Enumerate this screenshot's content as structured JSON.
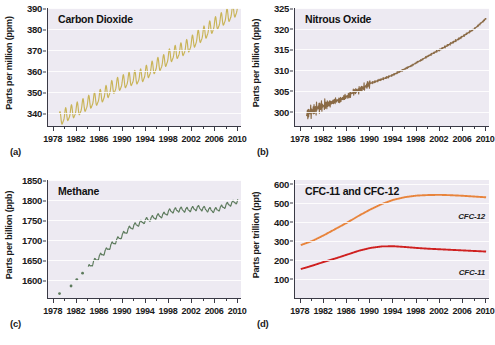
{
  "figure": {
    "panels": [
      {
        "letter": "(a)",
        "title": "Carbon Dioxide",
        "ylabel": "Parts per million (ppm)",
        "yticks": [
          340,
          350,
          360,
          370,
          380,
          390
        ],
        "ylim": [
          334,
          390
        ],
        "xticks": [
          1978,
          1982,
          1986,
          1990,
          1994,
          1998,
          2002,
          2006,
          2010
        ],
        "xlim": [
          1977,
          2010.5
        ],
        "color": "#c9b458"
      },
      {
        "letter": "(b)",
        "title": "Nitrous Oxide",
        "ylabel": "Parts per billion (ppb)",
        "yticks": [
          300,
          305,
          310,
          315,
          320,
          325
        ],
        "ylim": [
          296.5,
          325
        ],
        "xticks": [
          1978,
          1982,
          1986,
          1990,
          1994,
          1998,
          2002,
          2006,
          2010
        ],
        "xlim": [
          1977,
          2010.5
        ],
        "color": "#8a6a45"
      },
      {
        "letter": "(c)",
        "title": "Methane",
        "ylabel": "Parts per billion (ppb)",
        "yticks": [
          1600,
          1650,
          1700,
          1750,
          1800,
          1850
        ],
        "ylim": [
          1555,
          1850
        ],
        "xticks": [
          1978,
          1982,
          1986,
          1990,
          1994,
          1998,
          2002,
          2006,
          2010
        ],
        "xlim": [
          1977,
          2010.5
        ],
        "color": "#5c7a5c"
      },
      {
        "letter": "(d)",
        "title": "CFC-11 and CFC-12",
        "ylabel": "Parts per trillion (ppt)",
        "yticks": [
          100,
          200,
          300,
          400,
          500,
          600
        ],
        "ylim": [
          0,
          620
        ],
        "xticks": [
          1978,
          1982,
          1986,
          1990,
          1994,
          1998,
          2002,
          2006,
          2010
        ],
        "xlim": [
          1977,
          2010.5
        ],
        "series_labels": [
          "CFC-12",
          "CFC-11"
        ],
        "colors": [
          "#e8843c",
          "#cf2020"
        ]
      }
    ]
  },
  "chart_data": [
    {
      "type": "line",
      "title": "Carbon Dioxide",
      "xlabel": "",
      "ylabel": "Parts per million (ppm)",
      "xlim": [
        1977,
        2010.5
      ],
      "ylim": [
        334,
        390
      ],
      "grid": true,
      "series": [
        {
          "name": "CO2",
          "color": "#c9b458",
          "note": "annual sawtooth seasonal cycle of about 6 ppm amplitude superimposed on rising trend",
          "x": [
            1979,
            1980,
            1981,
            1982,
            1983,
            1984,
            1985,
            1986,
            1987,
            1988,
            1989,
            1990,
            1991,
            1992,
            1993,
            1994,
            1995,
            1996,
            1997,
            1998,
            1999,
            2000,
            2001,
            2002,
            2003,
            2004,
            2005,
            2006,
            2007,
            2008,
            2009,
            2010
          ],
          "values": [
            336.8,
            338.7,
            340.1,
            341.4,
            343.0,
            344.6,
            346.0,
            347.4,
            349.2,
            351.6,
            353.1,
            354.4,
            355.6,
            356.4,
            357.1,
            358.8,
            360.8,
            362.6,
            363.8,
            366.6,
            368.3,
            369.5,
            371.0,
            373.1,
            375.6,
            377.4,
            379.8,
            381.9,
            383.8,
            385.6,
            387.4,
            389.8
          ]
        }
      ]
    },
    {
      "type": "line",
      "title": "Nitrous Oxide",
      "xlabel": "",
      "ylabel": "Parts per billion (ppb)",
      "xlim": [
        1977,
        2010.5
      ],
      "ylim": [
        296.5,
        325
      ],
      "grid": true,
      "series": [
        {
          "name": "N2O",
          "color": "#8a6a45",
          "note": "noisy scatter before 1990, smoother steady rise afterwards",
          "x": [
            1979,
            1980,
            1981,
            1982,
            1983,
            1984,
            1985,
            1986,
            1987,
            1988,
            1989,
            1990,
            1991,
            1992,
            1993,
            1994,
            1995,
            1996,
            1997,
            1998,
            1999,
            2000,
            2001,
            2002,
            2003,
            2004,
            2005,
            2006,
            2007,
            2008,
            2009,
            2010
          ],
          "values": [
            299.3,
            300.2,
            301.0,
            301.4,
            302.0,
            302.5,
            303.0,
            303.6,
            304.6,
            305.2,
            305.9,
            306.8,
            307.3,
            307.8,
            308.3,
            308.9,
            309.6,
            310.3,
            311.0,
            311.8,
            312.6,
            313.4,
            314.2,
            314.9,
            315.7,
            316.5,
            317.3,
            318.2,
            319.1,
            320.0,
            321.2,
            322.5
          ]
        }
      ]
    },
    {
      "type": "line",
      "title": "Methane",
      "xlabel": "",
      "ylabel": "Parts per billion (ppb)",
      "xlim": [
        1977,
        2010.5
      ],
      "ylim": [
        1555,
        1850
      ],
      "grid": true,
      "series": [
        {
          "name": "CH4 early isolated measurements",
          "color": "#5c7a5c",
          "marker": "dot",
          "x": [
            1979,
            1981,
            1982,
            1983
          ],
          "values": [
            1566,
            1585,
            1601,
            1617
          ]
        },
        {
          "name": "CH4 continuous record",
          "color": "#5c7a5c",
          "note": "rapid rise to mid 1990s then plateau near 1775 ppb, renewed rise after 2007",
          "x": [
            1984,
            1985,
            1986,
            1987,
            1988,
            1989,
            1990,
            1991,
            1992,
            1993,
            1994,
            1995,
            1996,
            1997,
            1998,
            1999,
            2000,
            2001,
            2002,
            2003,
            2004,
            2005,
            2006,
            2007,
            2008,
            2009,
            2010
          ],
          "values": [
            1630,
            1646,
            1659,
            1672,
            1687,
            1700,
            1713,
            1727,
            1736,
            1742,
            1749,
            1754,
            1759,
            1762,
            1771,
            1774,
            1776,
            1775,
            1777,
            1780,
            1778,
            1775,
            1774,
            1780,
            1787,
            1792,
            1798
          ]
        }
      ]
    },
    {
      "type": "line",
      "title": "CFC-11 and CFC-12",
      "xlabel": "",
      "ylabel": "Parts per trillion (ppt)",
      "xlim": [
        1977,
        2010.5
      ],
      "ylim": [
        0,
        620
      ],
      "grid": true,
      "series": [
        {
          "name": "CFC-12",
          "color": "#e8843c",
          "note": "rises steeply then levels near 540 ppt after 1998 and declines slightly",
          "x": [
            1978,
            1980,
            1982,
            1984,
            1986,
            1988,
            1990,
            1992,
            1994,
            1996,
            1998,
            2000,
            2002,
            2004,
            2006,
            2008,
            2010
          ],
          "values": [
            278,
            300,
            330,
            363,
            396,
            432,
            465,
            494,
            516,
            530,
            538,
            541,
            542,
            540,
            537,
            533,
            529
          ]
        },
        {
          "name": "CFC-11",
          "color": "#cf2020",
          "note": "peaks near 272 ppt around 1993 then slowly declines",
          "x": [
            1978,
            1980,
            1982,
            1984,
            1986,
            1988,
            1990,
            1992,
            1994,
            1996,
            1998,
            2000,
            2002,
            2004,
            2006,
            2008,
            2010
          ],
          "values": [
            152,
            170,
            190,
            208,
            228,
            248,
            263,
            271,
            272,
            268,
            263,
            259,
            256,
            253,
            250,
            247,
            244
          ]
        }
      ]
    }
  ]
}
